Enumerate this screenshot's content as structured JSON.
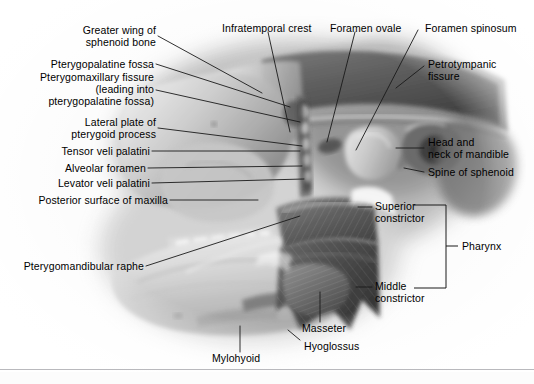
{
  "figure": {
    "kind": "anatomical-illustration",
    "style": "grayscale halftone photograph of a dissection/model",
    "background_color": "#fcfcfc",
    "leader_line_color": "#1a1a1a",
    "border_color": "#b9b9bd"
  },
  "labels": {
    "left": [
      {
        "id": "greater-wing-of-sphenoid-bone",
        "text": "Greater wing of\nsphenoid bone"
      },
      {
        "id": "pterygopalatine-fossa",
        "text": "Pterygopalatine fossa"
      },
      {
        "id": "pterygomaxillary-fissure",
        "text": "Pterygomaxillary fissure\n(leading into\npterygopalatine fossa)"
      },
      {
        "id": "lateral-plate-of-pterygoid-process",
        "text": "Lateral plate of\npterygoid process"
      },
      {
        "id": "tensor-veli-palatini",
        "text": "Tensor veli palatini"
      },
      {
        "id": "alveolar-foramen",
        "text": "Alveolar foramen"
      },
      {
        "id": "levator-veli-palatini",
        "text": "Levator veli palatini"
      },
      {
        "id": "posterior-surface-of-maxilla",
        "text": "Posterior surface of maxilla"
      },
      {
        "id": "pterygomandibular-raphe",
        "text": "Pterygomandibular raphe"
      }
    ],
    "top": [
      {
        "id": "infratemporal-crest",
        "text": "Infratemporal crest"
      },
      {
        "id": "foramen-ovale",
        "text": "Foramen ovale"
      },
      {
        "id": "foramen-spinosum",
        "text": "Foramen spinosum"
      }
    ],
    "right": [
      {
        "id": "petrotympanic-fissure",
        "text": "Petrotympanic\nfissure"
      },
      {
        "id": "head-and-neck-of-mandible",
        "text": "Head and\nneck of mandible"
      },
      {
        "id": "spine-of-sphenoid",
        "text": "Spine of sphenoid"
      },
      {
        "id": "superior-constrictor",
        "text": "Superior\nconstrictor"
      },
      {
        "id": "middle-constrictor",
        "text": "Middle\nconstrictor"
      },
      {
        "id": "pharynx",
        "text": "Pharynx"
      }
    ],
    "bottom": [
      {
        "id": "masseter",
        "text": "Masseter"
      },
      {
        "id": "hyoglossus",
        "text": "Hyoglossus"
      },
      {
        "id": "mylohyoid",
        "text": "Mylohyoid"
      }
    ]
  },
  "bracket": {
    "id": "pharynx-bracket",
    "groups": [
      "Superior\nconstrictor",
      "Middle\nconstrictor"
    ],
    "label": "Pharynx"
  }
}
